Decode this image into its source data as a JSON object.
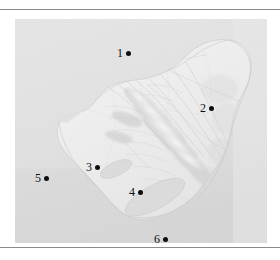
{
  "figure": {
    "frame": {
      "rule_color": "#8b8b8b",
      "background": "#ffffff"
    },
    "map": {
      "land_color": "#ededed",
      "ocean_color": "#e0e0e0",
      "lake_color": "#dcdcdc",
      "relief_shadow": "#c9c9c9",
      "border_color": "#cfcfcf",
      "marker_color": "#0d0d0d"
    },
    "markers": [
      {
        "label": "1",
        "x": 117,
        "y": 47,
        "dot_x": 130,
        "dot_y": 53
      },
      {
        "label": "2",
        "x": 200,
        "y": 102,
        "dot_x": 212,
        "dot_y": 108
      },
      {
        "label": "3",
        "x": 86,
        "y": 161,
        "dot_x": 99,
        "dot_y": 167
      },
      {
        "label": "4",
        "x": 129,
        "y": 186,
        "dot_x": 142,
        "dot_y": 192
      },
      {
        "label": "5",
        "x": 35,
        "y": 172,
        "dot_x": 48,
        "dot_y": 178
      },
      {
        "label": "6",
        "x": 154,
        "y": 233,
        "dot_x": 167,
        "dot_y": 239
      }
    ]
  }
}
